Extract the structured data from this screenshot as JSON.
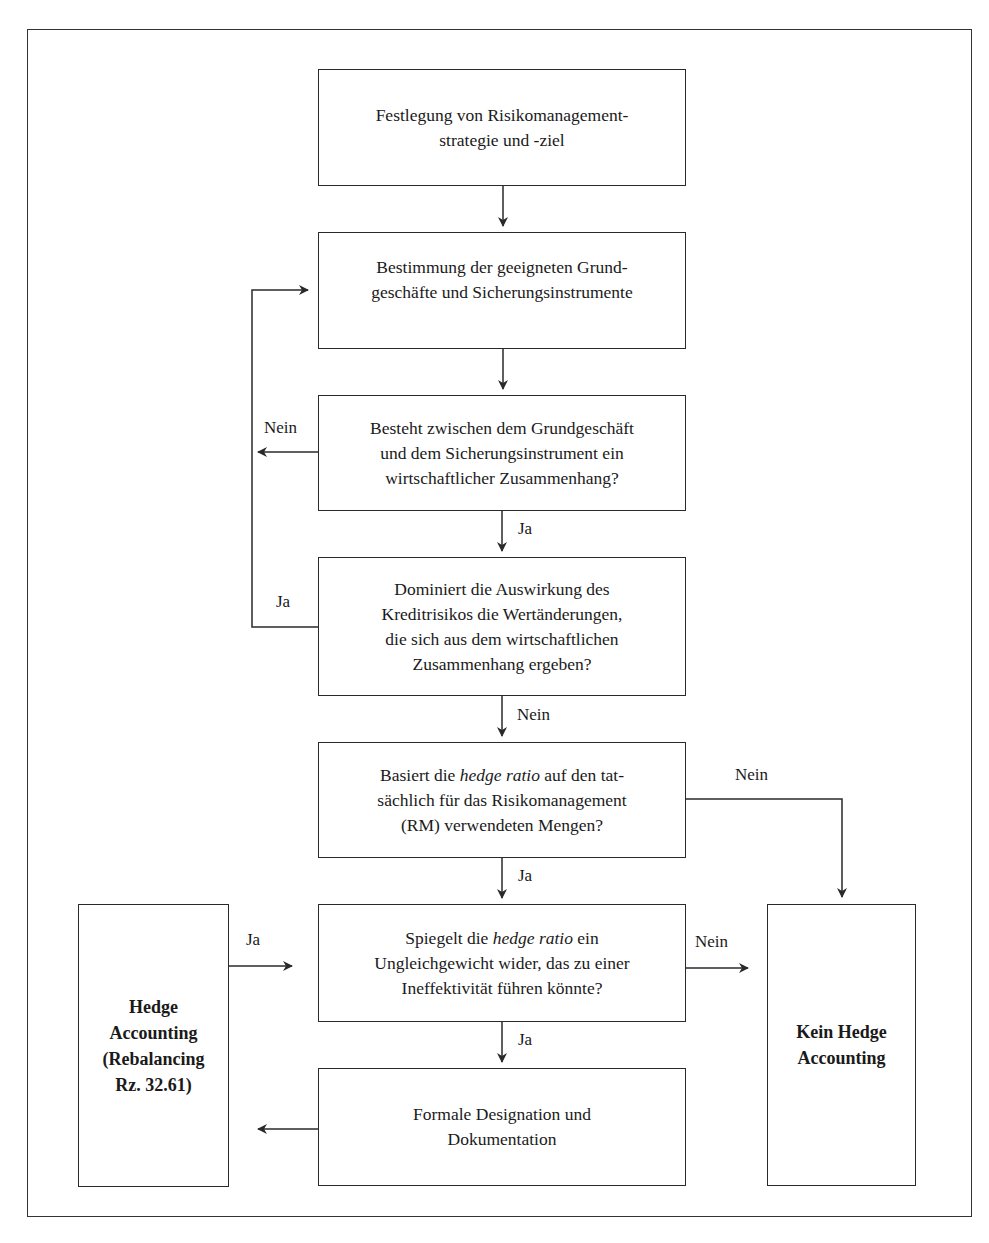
{
  "diagram": {
    "type": "flowchart",
    "nodes": {
      "n1": {
        "text": "Festlegung von Risikomanagement-\nstrategie und -ziel"
      },
      "n2": {
        "text": "Bestimmung der geeigneten Grund-\ngeschäfte und Sicherungsinstrumente"
      },
      "n3": {
        "text": "Besteht zwischen dem Grundgeschäft\nund dem Sicherungsinstrument ein\nwirtschaftlicher Zusammenhang?"
      },
      "n4": {
        "text": "Dominiert die Auswirkung des\nKreditrisikos die Wertänderungen,\ndie sich aus dem wirtschaftlichen\nZusammenhang ergeben?"
      },
      "n5": {
        "pre": "Basiert die ",
        "em": "hedge ratio",
        "post": " auf den tat-\nsächlich für das Risikomanagement\n(RM) verwendeten Mengen?"
      },
      "n6": {
        "pre": "Spiegelt die ",
        "em": "hedge ratio",
        "post": " ein\nUngleichgewicht wider, das zu einer\nIneffektivität führen könnte?"
      },
      "n7": {
        "text": "Formale Designation und\nDokumentation"
      },
      "left": {
        "text": "Hedge\nAccounting\n(Rebalancing\nRz. 32.61)"
      },
      "right": {
        "text": "Kein Hedge\nAccounting"
      }
    },
    "edge_labels": {
      "n3_no": "Nein",
      "n3_yes": "Ja",
      "n4_yes": "Ja",
      "n4_no": "Nein",
      "n5_no": "Nein",
      "n5_yes": "Ja",
      "left_yes": "Ja",
      "n6_no": "Nein",
      "n6_yes": "Ja"
    },
    "colors": {
      "line": "#2a2a2a",
      "background": "#ffffff"
    }
  }
}
